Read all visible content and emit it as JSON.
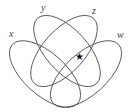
{
  "diagram": {
    "type": "venn-4-ellipses",
    "sets": [
      {
        "label": "x"
      },
      {
        "label": "y"
      },
      {
        "label": "z"
      },
      {
        "label": "w"
      }
    ],
    "marker": {
      "symbol": "★",
      "region": "y ∩ z ∩ w (outside x)"
    },
    "stroke_color": "#555555"
  }
}
